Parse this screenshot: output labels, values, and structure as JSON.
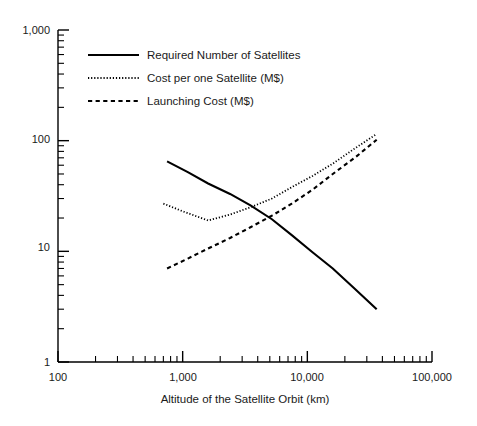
{
  "chart_data": {
    "type": "line",
    "title": "",
    "xlabel": "Altitude of the Satellite Orbit (km)",
    "ylabel": "",
    "xscale": "log",
    "yscale": "log",
    "xlim": [
      100,
      100000
    ],
    "ylim": [
      1,
      1000
    ],
    "grid": false,
    "legend_position": "upper-left-inside",
    "x_tick_labels": [
      "100",
      "1,000",
      "10,000",
      "100,000"
    ],
    "x_tick_values": [
      100,
      1000,
      10000,
      100000
    ],
    "y_tick_labels": [
      "1",
      "10",
      "100",
      "1,000"
    ],
    "y_tick_values": [
      1,
      10,
      100,
      1000
    ],
    "minor_ticks": "decade subdivisions 2-9 on both axes",
    "series": [
      {
        "name": "Required Number of Satellites",
        "style": "solid",
        "color": "#000000",
        "x": [
          750,
          1100,
          1600,
          2400,
          3500,
          5200,
          7500,
          11000,
          16000,
          24000,
          36000
        ],
        "y": [
          65,
          52,
          41,
          33,
          26,
          19.5,
          14,
          9.8,
          7.0,
          4.6,
          3.0
        ]
      },
      {
        "name": "Cost per one Satellite (M$)",
        "style": "dotted",
        "color": "#000000",
        "x": [
          700,
          1000,
          1600,
          2400,
          3500,
          5200,
          7500,
          11000,
          16000,
          24000,
          36000
        ],
        "y": [
          27,
          23,
          19,
          21.5,
          25,
          30,
          38,
          48,
          62,
          85,
          115
        ]
      },
      {
        "name": "Launching Cost (M$)",
        "style": "dashed",
        "color": "#000000",
        "x": [
          750,
          1100,
          1600,
          2400,
          3500,
          5200,
          7500,
          11000,
          16000,
          24000,
          36000
        ],
        "y": [
          7.0,
          8.6,
          10.6,
          13.2,
          16.5,
          21,
          27,
          36,
          50,
          70,
          102
        ]
      }
    ]
  },
  "axes": {
    "x_title": "Altitude of the Satellite Orbit (km)",
    "x_ticks": [
      {
        "label": "100",
        "value": 100
      },
      {
        "label": "1,000",
        "value": 1000
      },
      {
        "label": "10,000",
        "value": 10000
      },
      {
        "label": "100,000",
        "value": 100000
      }
    ],
    "y_ticks": [
      {
        "label": "1",
        "value": 1
      },
      {
        "label": "10",
        "value": 10
      },
      {
        "label": "100",
        "value": 100
      },
      {
        "label": "1,000",
        "value": 1000
      }
    ]
  },
  "legend": {
    "items": [
      {
        "label": "Required Number of Satellites",
        "style": "solid"
      },
      {
        "label": "Cost per one Satellite (M$)",
        "style": "dotted"
      },
      {
        "label": "Launching Cost (M$)",
        "style": "dashed"
      }
    ]
  }
}
